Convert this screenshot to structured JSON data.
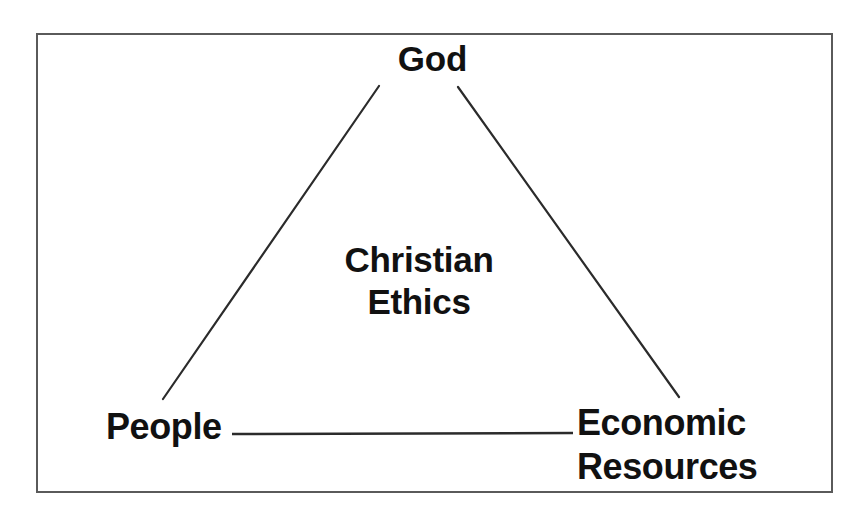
{
  "diagram": {
    "shape": "triangle",
    "stroke_color": "#2b2b2b",
    "frame_color": "#5a5a5a",
    "background_color": "#ffffff",
    "text_color": "#111111",
    "center": {
      "line1": "Christian",
      "line2": "Ethics"
    },
    "vertices": {
      "top": "God",
      "bottom_left": "People",
      "bottom_right_line1": "Economic",
      "bottom_right_line2": "Resources"
    },
    "edges": [
      {
        "name": "god-to-people",
        "from": "God",
        "to": "People"
      },
      {
        "name": "god-to-economic-resources",
        "from": "God",
        "to": "Economic Resources"
      },
      {
        "name": "people-to-economic-resources",
        "from": "People",
        "to": "Economic Resources"
      }
    ]
  }
}
